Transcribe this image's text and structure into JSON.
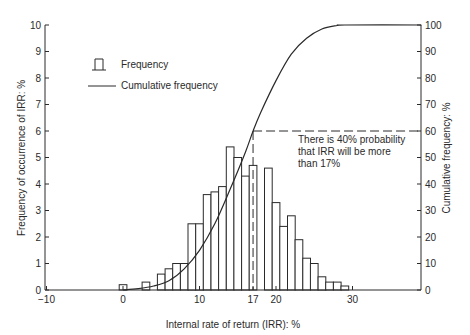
{
  "chart_data": {
    "type": "bar",
    "title": "",
    "xlabel": "Internal rate of return (IRR): %",
    "ylabel": "Frequency of occurrence of IRR: %",
    "y2label": "Cumulative frequency: %",
    "xlim": [
      -10,
      39
    ],
    "ylim": [
      0,
      10
    ],
    "y2lim": [
      0,
      100
    ],
    "grid": false,
    "legend_position": "upper-left",
    "x_ticks": [
      -10,
      0,
      10,
      17,
      20,
      30
    ],
    "x_tick_labels": [
      "−10",
      "0",
      "10",
      "17",
      "20",
      "30"
    ],
    "y_ticks": [
      0,
      1,
      2,
      3,
      4,
      5,
      6,
      7,
      8,
      9,
      10
    ],
    "y2_ticks": [
      0,
      10,
      20,
      30,
      40,
      50,
      60,
      70,
      80,
      90,
      100
    ],
    "bar_width": 1,
    "categories": [
      0,
      1,
      2,
      3,
      4,
      5,
      6,
      7,
      8,
      9,
      10,
      11,
      12,
      13,
      14,
      15,
      16,
      17,
      18,
      19,
      20,
      21,
      22,
      23,
      24,
      25,
      26,
      27,
      28,
      29
    ],
    "series": [
      {
        "name": "Frequency",
        "type": "bar",
        "axis": "left",
        "values": [
          0.2,
          0,
          0,
          0.3,
          0,
          0.6,
          0.8,
          1.0,
          1.0,
          2.5,
          2.5,
          3.6,
          3.7,
          3.9,
          5.4,
          5.0,
          4.3,
          4.7,
          0,
          4.6,
          3.3,
          2.4,
          2.8,
          1.9,
          1.2,
          1.0,
          0.5,
          0.3,
          0.3,
          0.15
        ]
      },
      {
        "name": "Cumulative frequency",
        "type": "line",
        "axis": "right",
        "x": [
          0,
          2,
          4,
          6,
          8,
          10,
          12,
          14,
          16,
          17,
          18,
          20,
          22,
          24,
          26,
          28,
          29,
          39
        ],
        "values": [
          0,
          0.5,
          1.5,
          3.5,
          8,
          15,
          25,
          38,
          52,
          60,
          67,
          79,
          89,
          95,
          98.5,
          99.8,
          100,
          100
        ]
      }
    ],
    "annotations": [
      {
        "text_lines": [
          "There is 40% probability",
          "that IRR will be more",
          "than 17%"
        ],
        "reference_x": 17,
        "reference_y2": 60,
        "style": "dashed lines"
      }
    ]
  },
  "legend": {
    "items": [
      {
        "label": "Frequency",
        "icon": "bar-symbol"
      },
      {
        "label": "Cumulative frequency",
        "icon": "line-symbol"
      }
    ]
  },
  "axes": {
    "x_title": "Internal rate of return (IRR): %",
    "y_left_title": "Frequency of occurrence of IRR: %",
    "y_right_title": "Cumulative frequency: %"
  },
  "annotation": {
    "line1": "There is 40% probability",
    "line2": "that IRR will be more",
    "line3": "than 17%"
  },
  "colors": {
    "ink": "#2a2a2a",
    "background": "#ffffff"
  }
}
